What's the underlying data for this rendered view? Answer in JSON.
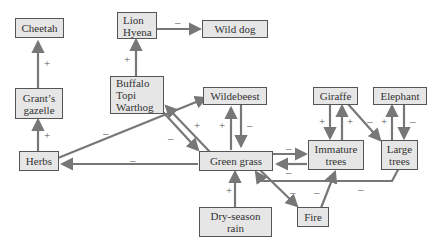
{
  "nodes": {
    "cheetah": "Cheetah",
    "grants_gazelle": "Grant’s\ngazelle",
    "lion_hyena": "Lion\nHyena",
    "wild_dog": "Wild dog",
    "buffalo_topi_warthog": "Buffalo\nTopi\nWarthog",
    "wildebeest": "Wildebeest",
    "giraffe": "Giraffe",
    "elephant": "Elephant",
    "herbs": "Herbs",
    "green_grass": "Green grass",
    "immature_trees": "Immature\ntrees",
    "large_trees": "Large\ntrees",
    "dry_season_rain": "Dry-season\nrain",
    "fire": "Fire"
  },
  "signs": {
    "plus": "+",
    "minus": "–"
  },
  "edges": [
    {
      "from": "Grant’s gazelle",
      "to": "Cheetah",
      "sign": "+"
    },
    {
      "from": "Herbs",
      "to": "Grant’s gazelle",
      "sign": "+"
    },
    {
      "from": "Buffalo Topi Warthog",
      "to": "Lion Hyena",
      "sign": "+"
    },
    {
      "from": "Lion Hyena",
      "to": "Wild dog",
      "sign": "–"
    },
    {
      "from": "Herbs",
      "to": "Wildebeest",
      "sign": "–"
    },
    {
      "from": "Buffalo Topi Warthog",
      "to": "Green grass",
      "sign": "–"
    },
    {
      "from": "Green grass",
      "to": "Buffalo Topi Warthog",
      "sign": "+"
    },
    {
      "from": "Green grass",
      "to": "Wildebeest",
      "sign": "+"
    },
    {
      "from": "Wildebeest",
      "to": "Green grass",
      "sign": "–"
    },
    {
      "from": "Green grass",
      "to": "Herbs",
      "sign": "–"
    },
    {
      "from": "Green grass",
      "to": "Immature trees",
      "sign": "–"
    },
    {
      "from": "Immature trees",
      "to": "Green grass",
      "sign": "–"
    },
    {
      "from": "Giraffe",
      "to": "Immature trees",
      "sign": "+"
    },
    {
      "from": "Immature trees",
      "to": "Giraffe",
      "sign": "+"
    },
    {
      "from": "Giraffe",
      "to": "Large trees",
      "sign": "–"
    },
    {
      "from": "Large trees",
      "to": "Elephant",
      "sign": "+"
    },
    {
      "from": "Elephant",
      "to": "Large trees",
      "sign": "–"
    },
    {
      "from": "Large trees",
      "to": "Green grass",
      "sign": "–"
    },
    {
      "from": "Dry-season rain",
      "to": "Green grass",
      "sign": "+"
    },
    {
      "from": "Green grass",
      "to": "Fire",
      "sign": "–"
    },
    {
      "from": "Fire",
      "to": "Immature trees",
      "sign": "–"
    }
  ]
}
